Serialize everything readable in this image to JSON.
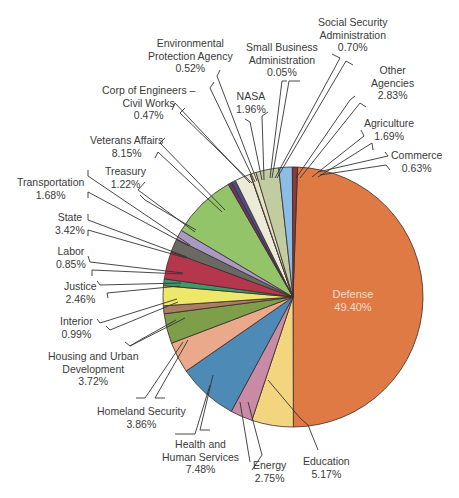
{
  "chart_data": {
    "type": "pie",
    "title": "",
    "start_angle_deg": 2,
    "direction": "clockwise",
    "slices": [
      {
        "name": "Defense",
        "value": 49.4,
        "label": "49.40%",
        "color": "#e07a45"
      },
      {
        "name": "Education",
        "value": 5.17,
        "label": "5.17%",
        "color": "#f3d57f"
      },
      {
        "name": "Energy",
        "value": 2.75,
        "label": "2.75%",
        "color": "#c88aa4"
      },
      {
        "name": "Health and Human Services",
        "value": 7.48,
        "label": "7.48%",
        "color": "#4d8ab5"
      },
      {
        "name": "Homeland Security",
        "value": 3.86,
        "label": "3.86%",
        "color": "#e9a98a"
      },
      {
        "name": "Housing and Urban Development",
        "value": 3.72,
        "label": "3.72%",
        "color": "#7e9e4a"
      },
      {
        "name": "Interior",
        "value": 0.99,
        "label": "0.99%",
        "color": "#a97f64"
      },
      {
        "name": "Justice",
        "value": 2.46,
        "label": "2.46%",
        "color": "#eee86a"
      },
      {
        "name": "Labor",
        "value": 0.85,
        "label": "0.85%",
        "color": "#3f9a6a"
      },
      {
        "name": "State",
        "value": 3.42,
        "label": "3.42%",
        "color": "#b5374d"
      },
      {
        "name": "Transportation",
        "value": 1.68,
        "label": "1.68%",
        "color": "#6b6a62"
      },
      {
        "name": "Treasury",
        "value": 1.22,
        "label": "1.22%",
        "color": "#a99ac4"
      },
      {
        "name": "Veterans Affairs",
        "value": 8.15,
        "label": "8.15%",
        "color": "#94c46a"
      },
      {
        "name": "Corp of Engineers – Civil Works",
        "value": 0.47,
        "label": "0.47%",
        "color": "#6a3a5a"
      },
      {
        "name": "Environmental Protection Agency",
        "value": 0.52,
        "label": "0.52%",
        "color": "#4a4f8a"
      },
      {
        "name": "NASA",
        "value": 1.96,
        "label": "1.96%",
        "color": "#ecebd8"
      },
      {
        "name": "Small Business Administration",
        "value": 0.05,
        "label": "0.05%",
        "color": "#d8dcb0"
      },
      {
        "name": "Social Security Administration",
        "value": 0.7,
        "label": "0.70%",
        "color": "#e4e3c2"
      },
      {
        "name": "Other Agencies",
        "value": 2.83,
        "label": "2.83%",
        "color": "#c1cda0"
      },
      {
        "name": "Agriculture",
        "value": 1.69,
        "label": "1.69%",
        "color": "#8cbde4"
      },
      {
        "name": "Commerce",
        "value": 0.63,
        "label": "0.63%",
        "color": "#8a3a3a"
      }
    ],
    "legend": "none (callout labels)"
  },
  "labels": {
    "defense": {
      "name": "Defense",
      "pct": "49.40%"
    },
    "education": {
      "name": "Education",
      "pct": "5.17%"
    },
    "energy": {
      "name": "Energy",
      "pct": "2.75%"
    },
    "hhs": {
      "line1": "Health and",
      "line2": "Human Services",
      "pct": "7.48%"
    },
    "homeland": {
      "name": "Homeland Security",
      "pct": "3.86%"
    },
    "hud": {
      "line1": "Housing and Urban",
      "line2": "Development",
      "pct": "3.72%"
    },
    "interior": {
      "name": "Interior",
      "pct": "0.99%"
    },
    "justice": {
      "name": "Justice",
      "pct": "2.46%"
    },
    "labor": {
      "name": "Labor",
      "pct": "0.85%"
    },
    "state": {
      "name": "State",
      "pct": "3.42%"
    },
    "transportation": {
      "name": "Transportation",
      "pct": "1.68%"
    },
    "treasury": {
      "name": "Treasury",
      "pct": "1.22%"
    },
    "veterans": {
      "name": "Veterans Affairs",
      "pct": "8.15%"
    },
    "corps": {
      "line1": "Corp of Engineers –",
      "line2": "Civil Works",
      "pct": "0.47%"
    },
    "epa": {
      "line1": "Environmental",
      "line2": "Protection Agency",
      "pct": "0.52%"
    },
    "nasa": {
      "name": "NASA",
      "pct": "1.96%"
    },
    "sba": {
      "line1": "Small Business",
      "line2": "Administration",
      "pct": "0.05%"
    },
    "ssa": {
      "line1": "Social Security",
      "line2": "Administration",
      "pct": "0.70%"
    },
    "other": {
      "line1": "Other",
      "line2": "Agencies",
      "pct": "2.83%"
    },
    "agriculture": {
      "name": "Agriculture",
      "pct": "1.69%"
    },
    "commerce": {
      "name": "Commerce",
      "pct": "0.63%"
    }
  },
  "leaders": [
    {
      "slice": "Education",
      "pts": [
        [
          268,
          380
        ],
        [
          300,
          418
        ],
        [
          308,
          425
        ],
        [
          318,
          450
        ]
      ]
    },
    {
      "slice": "Energy",
      "pts": [
        [
          248,
          402
        ],
        [
          262,
          455
        ],
        [
          252,
          470
        ]
      ]
    },
    {
      "slice": "Energy",
      "pts": [
        [
          240,
          402
        ],
        [
          250,
          462
        ]
      ]
    },
    {
      "slice": "Health and Human Services",
      "pts": [
        [
          213,
          375
        ],
        [
          200,
          430
        ],
        [
          210,
          430
        ]
      ]
    },
    {
      "slice": "Health and Human Services",
      "pts": [
        [
          210,
          385
        ],
        [
          195,
          434
        ],
        [
          175,
          434
        ]
      ]
    },
    {
      "slice": "Homeland Security",
      "pts": [
        [
          188,
          340
        ],
        [
          155,
          398
        ],
        [
          165,
          398
        ]
      ]
    },
    {
      "slice": "Homeland Security",
      "pts": [
        [
          183,
          342
        ],
        [
          145,
          398
        ],
        [
          136,
          398
        ]
      ]
    },
    {
      "slice": "Housing and Urban Development",
      "pts": [
        [
          185,
          318
        ],
        [
          130,
          346
        ],
        [
          125,
          342
        ]
      ]
    },
    {
      "slice": "Housing and Urban Development",
      "pts": [
        [
          176,
          320
        ],
        [
          140,
          340
        ],
        [
          130,
          346
        ]
      ]
    },
    {
      "slice": "Interior",
      "pts": [
        [
          177,
          299
        ],
        [
          100,
          323
        ],
        [
          97,
          319
        ]
      ]
    },
    {
      "slice": "Interior",
      "pts": [
        [
          178,
          302
        ],
        [
          110,
          330
        ],
        [
          106,
          326
        ]
      ]
    },
    {
      "slice": "Justice",
      "pts": [
        [
          181,
          283
        ],
        [
          100,
          285
        ],
        [
          97,
          281
        ]
      ]
    },
    {
      "slice": "Justice",
      "pts": [
        [
          180,
          286
        ],
        [
          107,
          293
        ],
        [
          108,
          298
        ]
      ]
    },
    {
      "slice": "Labor",
      "pts": [
        [
          183,
          273
        ],
        [
          90,
          262
        ],
        [
          88,
          256
        ]
      ]
    },
    {
      "slice": "Labor",
      "pts": [
        [
          182,
          274
        ],
        [
          92,
          270
        ],
        [
          92,
          276
        ]
      ]
    },
    {
      "slice": "State",
      "pts": [
        [
          187,
          257
        ],
        [
          88,
          220
        ],
        [
          88,
          214
        ]
      ]
    },
    {
      "slice": "State",
      "pts": [
        [
          186,
          258
        ],
        [
          88,
          230
        ],
        [
          88,
          236
        ]
      ]
    },
    {
      "slice": "Transportation",
      "pts": [
        [
          190,
          245
        ],
        [
          88,
          176
        ],
        [
          88,
          170
        ]
      ]
    },
    {
      "slice": "Transportation",
      "pts": [
        [
          189,
          246
        ],
        [
          88,
          192
        ],
        [
          88,
          198
        ]
      ]
    },
    {
      "slice": "Treasury",
      "pts": [
        [
          196,
          230
        ],
        [
          145,
          200
        ],
        [
          140,
          195
        ]
      ]
    },
    {
      "slice": "Treasury",
      "pts": [
        [
          195,
          232
        ],
        [
          138,
          190
        ],
        [
          145,
          182
        ]
      ]
    },
    {
      "slice": "Veterans Affairs",
      "pts": [
        [
          225,
          210
        ],
        [
          160,
          143
        ],
        [
          165,
          138
        ]
      ]
    },
    {
      "slice": "Veterans Affairs",
      "pts": [
        [
          222,
          212
        ],
        [
          158,
          152
        ],
        [
          155,
          158
        ]
      ]
    },
    {
      "slice": "Corp of Engineers",
      "pts": [
        [
          250,
          183
        ],
        [
          175,
          103
        ],
        [
          172,
          110
        ]
      ]
    },
    {
      "slice": "Corp of Engineers",
      "pts": [
        [
          252,
          183
        ],
        [
          180,
          113
        ],
        [
          185,
          108
        ]
      ]
    },
    {
      "slice": "Environmental Protection Agency",
      "pts": [
        [
          255,
          182
        ],
        [
          210,
          88
        ],
        [
          214,
          82
        ]
      ]
    },
    {
      "slice": "Environmental Protection Agency",
      "pts": [
        [
          257,
          181
        ],
        [
          217,
          76
        ],
        [
          220,
          70
        ]
      ]
    },
    {
      "slice": "NASA",
      "pts": [
        [
          262,
          180
        ],
        [
          250,
          122
        ],
        [
          245,
          119
        ]
      ]
    },
    {
      "slice": "NASA",
      "pts": [
        [
          264,
          180
        ],
        [
          262,
          116
        ],
        [
          268,
          112
        ]
      ]
    },
    {
      "slice": "Small Business Administration",
      "pts": [
        [
          270,
          178
        ],
        [
          282,
          81
        ],
        [
          287,
          81
        ]
      ]
    },
    {
      "slice": "Small Business Administration",
      "pts": [
        [
          272,
          178
        ],
        [
          289,
          81
        ],
        [
          300,
          81
        ]
      ]
    },
    {
      "slice": "Social Security Administration",
      "pts": [
        [
          275,
          178
        ],
        [
          340,
          58
        ],
        [
          332,
          54
        ]
      ]
    },
    {
      "slice": "Social Security Administration",
      "pts": [
        [
          277,
          178
        ],
        [
          346,
          61
        ],
        [
          353,
          65
        ]
      ]
    },
    {
      "slice": "Other Agencies",
      "pts": [
        [
          296,
          178
        ],
        [
          350,
          100
        ],
        [
          355,
          96
        ]
      ]
    },
    {
      "slice": "Other Agencies",
      "pts": [
        [
          300,
          178
        ],
        [
          360,
          103
        ],
        [
          366,
          107
        ]
      ]
    },
    {
      "slice": "Agriculture",
      "pts": [
        [
          312,
          177
        ],
        [
          364,
          136
        ],
        [
          361,
          130
        ]
      ]
    },
    {
      "slice": "Agriculture",
      "pts": [
        [
          318,
          177
        ],
        [
          372,
          143
        ],
        [
          373,
          150
        ]
      ]
    },
    {
      "slice": "Commerce",
      "pts": [
        [
          318,
          172
        ],
        [
          388,
          156
        ],
        [
          385,
          152
        ]
      ]
    },
    {
      "slice": "Commerce",
      "pts": [
        [
          320,
          175
        ],
        [
          386,
          165
        ],
        [
          390,
          170
        ]
      ]
    }
  ],
  "pie": {
    "cx": 293,
    "cy": 297,
    "r": 130,
    "stroke": "#3a2a2a"
  },
  "label_color": "#3a3a3a",
  "leader_color": "#333333"
}
